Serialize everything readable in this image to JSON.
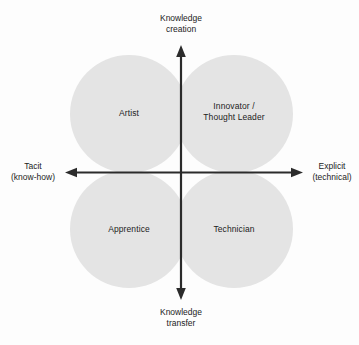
{
  "figure": {
    "type": "2x2-quadrant-diagram",
    "background_color": "#fdfdfd",
    "lobe_color": "#e4e4e4",
    "axis_color": "#2b2b2b",
    "text_color": "#1c1c1c"
  },
  "axes": {
    "vertical": {
      "top_label": "Knowledge\ncreation",
      "bottom_label": "Knowledge\ntransfer"
    },
    "horizontal": {
      "left_label": "Tacit\n(know-how)",
      "right_label": "Explicit\n(technical)"
    }
  },
  "quadrants": [
    {
      "position": "top-left",
      "label": "Artist"
    },
    {
      "position": "top-right",
      "label": "Innovator /\nThought Leader"
    },
    {
      "position": "bottom-left",
      "label": "Apprentice"
    },
    {
      "position": "bottom-right",
      "label": "Technician"
    }
  ]
}
